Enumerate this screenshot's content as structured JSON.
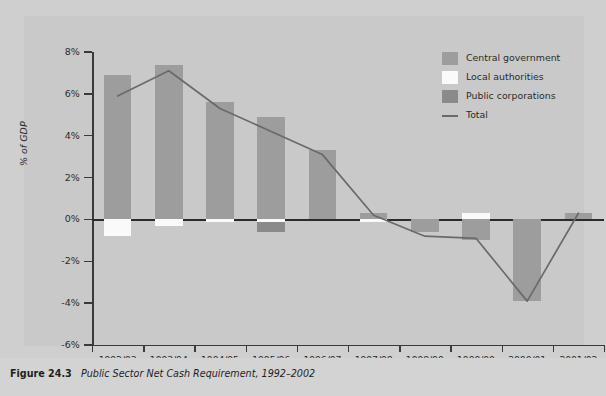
{
  "caption": {
    "figure_number": "Figure 24.3",
    "title": "Public Sector Net Cash Requirement, 1992–2002"
  },
  "legend": {
    "position": "top-right",
    "items": [
      {
        "label": "Central government",
        "type": "swatch",
        "color": "#9d9d9d"
      },
      {
        "label": "Local authorities",
        "type": "swatch",
        "color": "#fafafa"
      },
      {
        "label": "Public corporations",
        "type": "swatch",
        "color": "#8a8a8a"
      },
      {
        "label": "Total",
        "type": "line",
        "color": "#6a6a6a"
      }
    ]
  },
  "chart_data": {
    "type": "bar",
    "title": "Public Sector Net Cash Requirement, 1992–2002",
    "subtitle": "",
    "xlabel": "",
    "ylabel": "% of GDP",
    "ylim": [
      -6,
      8
    ],
    "yticks": [
      8,
      6,
      4,
      2,
      0,
      -2,
      -4,
      -6
    ],
    "ytick_labels": [
      "8%",
      "6%",
      "4%",
      "2%",
      "0%",
      "-2%",
      "-4%",
      "-6%"
    ],
    "grid": false,
    "zero_line": true,
    "categories": [
      "1992/93",
      "1993/94",
      "1994/95",
      "1995/96",
      "1996/97",
      "1997/98",
      "1998/99",
      "1999/00",
      "2000/01",
      "2001/02"
    ],
    "series": [
      {
        "name": "Central government",
        "color": "#9d9d9d",
        "values": [
          6.9,
          7.4,
          5.6,
          4.9,
          3.3,
          0.3,
          -0.6,
          -1.0,
          -3.9,
          0.3
        ]
      },
      {
        "name": "Local authorities",
        "color": "#fafafa",
        "values": [
          -0.8,
          -0.3,
          -0.1,
          -0.1,
          0.0,
          -0.1,
          0.0,
          0.3,
          0.0,
          0.0
        ]
      },
      {
        "name": "Public corporations",
        "color": "#8a8a8a",
        "values": [
          0.0,
          0.0,
          0.0,
          -0.5,
          0.0,
          0.0,
          0.0,
          0.0,
          0.0,
          0.0
        ]
      },
      {
        "name": "Total",
        "color": "#6a6a6a",
        "type": "line",
        "values": [
          5.9,
          7.1,
          5.3,
          4.2,
          3.1,
          0.2,
          -0.8,
          -0.9,
          -3.9,
          0.3
        ]
      }
    ]
  }
}
